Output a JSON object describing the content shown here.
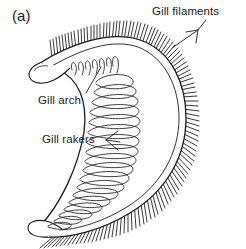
{
  "figure": {
    "panel_label": "(a)",
    "background_color": "#ffffff",
    "ink_color": "#1b1b1b"
  },
  "labels": {
    "gill_filaments": "Gill filaments",
    "gill_arch": "Gill arch",
    "gill_rakers": "Gill rakers"
  },
  "structures": {
    "arch": {
      "name": "gill-arch",
      "description": "thick white curved band bending from upper-left to lower-left through a right-hand apex",
      "outline_color": "#1b1b1b",
      "fill_color": "#ffffff"
    },
    "filaments": {
      "name": "gill-filaments",
      "description": "dense parallel hair-like projections radiating outward from the convex edge of the arch",
      "count": 150,
      "color": "#3a3a3a"
    },
    "rakers": {
      "name": "gill-rakers",
      "description": "elongated looped comb-like projections along the concave inner edge of the arch",
      "count": 34,
      "color": "#2a2a2a"
    }
  },
  "leaders": {
    "filaments_leader": "arrow from Gill filaments text down-left into filament row",
    "arch_leader": "line from Gill arch text up-right to arch band",
    "rakers_leader": "forked line from Gill rakers text right to several rakers"
  }
}
